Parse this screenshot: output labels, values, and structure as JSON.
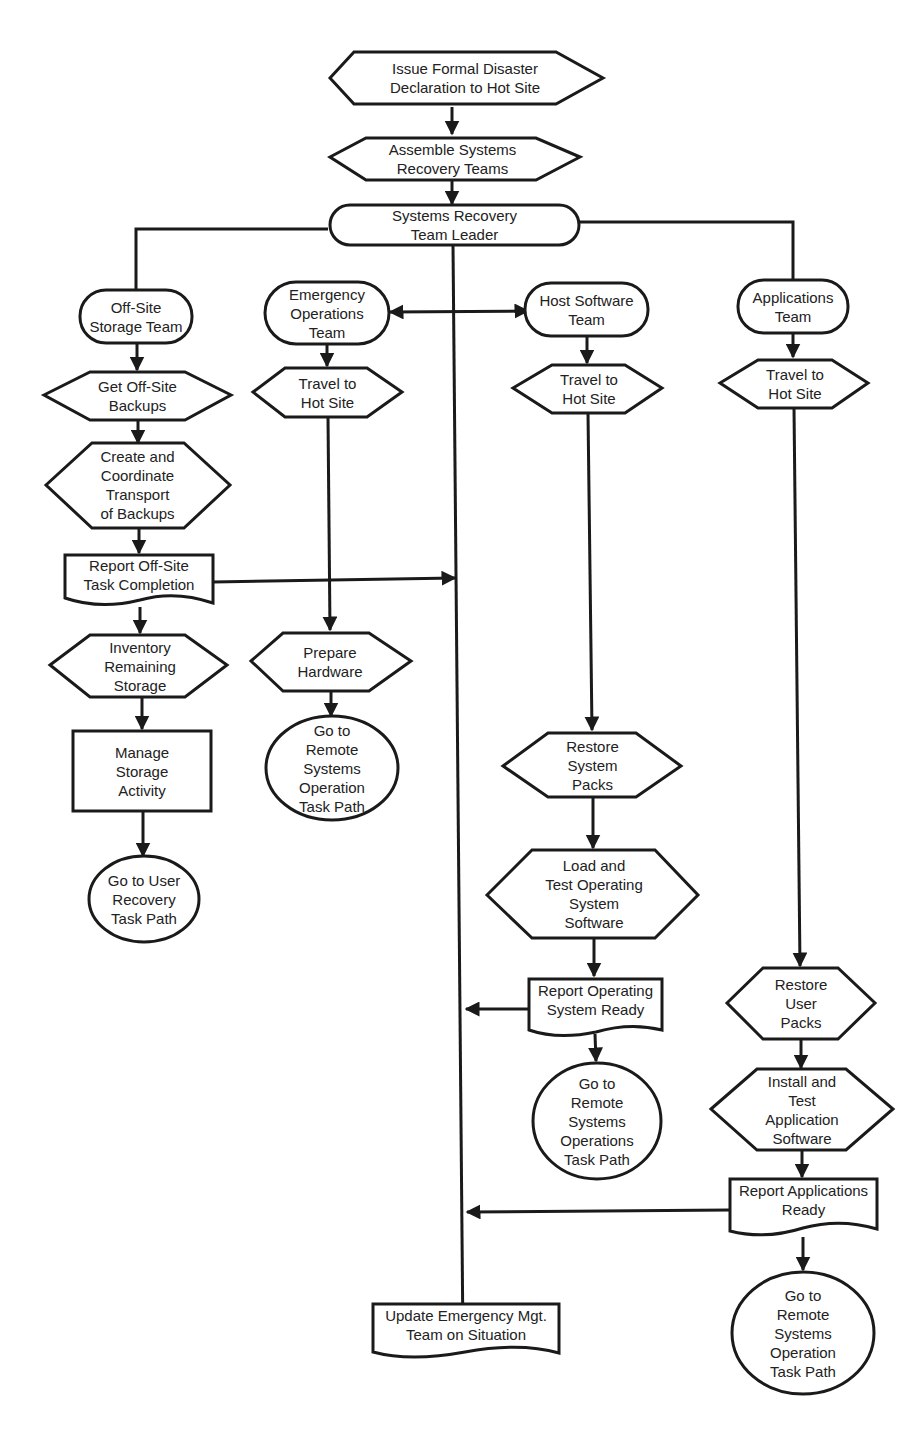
{
  "diagram": {
    "type": "flowchart",
    "colors": {
      "stroke": "#1a1a1a",
      "fill": "#ffffff",
      "text": "#222222",
      "background": "#ffffff"
    },
    "nodes": {
      "declare": {
        "shape": "hexagon",
        "label": "Issue Formal Disaster\nDeclaration to Hot Site"
      },
      "assemble": {
        "shape": "hexagon",
        "label": "Assemble Systems\nRecovery Teams"
      },
      "leader": {
        "shape": "terminator",
        "label": "Systems Recovery\nTeam Leader"
      },
      "offsite_team": {
        "shape": "terminator",
        "label": "Off-Site\nStorage Team"
      },
      "get_backups": {
        "shape": "hexagon",
        "label": "Get Off-Site\nBackups"
      },
      "transport": {
        "shape": "hexagon",
        "label": "Create and\nCoordinate\nTransport\nof Backups"
      },
      "report_offsite": {
        "shape": "document",
        "label": "Report Off-Site\nTask Completion"
      },
      "inventory": {
        "shape": "hexagon",
        "label": "Inventory\nRemaining\nStorage"
      },
      "manage_storage": {
        "shape": "rectangle",
        "label": "Manage\nStorage\nActivity"
      },
      "goto_user_recovery": {
        "shape": "circle",
        "label": "Go to User\nRecovery\nTask Path"
      },
      "emergency_team": {
        "shape": "terminator",
        "label": "Emergency\nOperations\nTeam"
      },
      "eo_travel": {
        "shape": "hexagon",
        "label": "Travel to\nHot Site"
      },
      "prepare_hw": {
        "shape": "hexagon",
        "label": "Prepare\nHardware"
      },
      "eo_goto_remote": {
        "shape": "circle",
        "label": "Go to\nRemote\nSystems\nOperation\nTask Path"
      },
      "host_team": {
        "shape": "terminator",
        "label": "Host Software\nTeam"
      },
      "hs_travel": {
        "shape": "hexagon",
        "label": "Travel to\nHot Site"
      },
      "restore_sys": {
        "shape": "hexagon",
        "label": "Restore\nSystem\nPacks"
      },
      "load_os": {
        "shape": "hexagon",
        "label": "Load and\nTest Operating\nSystem\nSoftware"
      },
      "report_os": {
        "shape": "document",
        "label": "Report Operating\nSystem Ready"
      },
      "hs_goto_remote": {
        "shape": "circle",
        "label": "Go to\nRemote\nSystems\nOperations\nTask Path"
      },
      "apps_team": {
        "shape": "terminator",
        "label": "Applications\nTeam"
      },
      "ap_travel": {
        "shape": "hexagon",
        "label": "Travel to\nHot Site"
      },
      "restore_user": {
        "shape": "hexagon",
        "label": "Restore\nUser\nPacks"
      },
      "install_apps": {
        "shape": "hexagon",
        "label": "Install and\nTest\nApplication\nSoftware"
      },
      "report_apps": {
        "shape": "document",
        "label": "Report Applications\nReady"
      },
      "ap_goto_remote": {
        "shape": "circle",
        "label": "Go to\nRemote\nSystems\nOperation\nTask Path"
      },
      "update_emt": {
        "shape": "document",
        "label": "Update Emergency Mgt.\nTeam on Situation"
      }
    },
    "edges": [
      [
        "declare",
        "assemble"
      ],
      [
        "assemble",
        "leader"
      ],
      [
        "leader",
        "offsite_team"
      ],
      [
        "leader",
        "apps_team"
      ],
      [
        "leader",
        "update_emt"
      ],
      [
        "leader",
        "emergency_team"
      ],
      [
        "leader",
        "host_team"
      ],
      [
        "offsite_team",
        "get_backups"
      ],
      [
        "get_backups",
        "transport"
      ],
      [
        "transport",
        "report_offsite"
      ],
      [
        "report_offsite",
        "update_emt"
      ],
      [
        "report_offsite",
        "inventory"
      ],
      [
        "inventory",
        "manage_storage"
      ],
      [
        "manage_storage",
        "goto_user_recovery"
      ],
      [
        "emergency_team",
        "eo_travel"
      ],
      [
        "eo_travel",
        "prepare_hw"
      ],
      [
        "prepare_hw",
        "eo_goto_remote"
      ],
      [
        "host_team",
        "hs_travel"
      ],
      [
        "hs_travel",
        "restore_sys"
      ],
      [
        "restore_sys",
        "load_os"
      ],
      [
        "load_os",
        "report_os"
      ],
      [
        "report_os",
        "update_emt"
      ],
      [
        "report_os",
        "hs_goto_remote"
      ],
      [
        "apps_team",
        "ap_travel"
      ],
      [
        "ap_travel",
        "restore_user"
      ],
      [
        "restore_user",
        "install_apps"
      ],
      [
        "install_apps",
        "report_apps"
      ],
      [
        "report_apps",
        "update_emt"
      ],
      [
        "report_apps",
        "ap_goto_remote"
      ]
    ]
  }
}
